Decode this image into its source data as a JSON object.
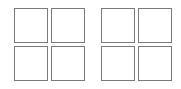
{
  "groups": [
    {
      "name": "left",
      "cells": 4,
      "rows": 2,
      "cols": 2
    },
    {
      "name": "right",
      "cells": 4,
      "rows": 2,
      "cols": 2
    }
  ],
  "colors": {
    "border": "#7a7a7a",
    "fill": "#ffffff",
    "background": "#ffffff"
  }
}
